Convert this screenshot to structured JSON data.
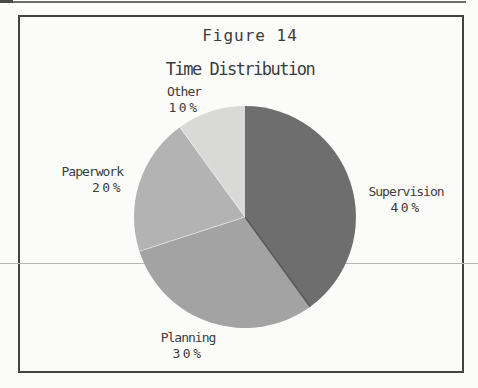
{
  "page": {
    "background_color": "#fbfbfa",
    "frame_border_color": "#434343",
    "text_color": "#3c3c3c"
  },
  "chart_data": {
    "type": "pie",
    "title": "Figure 14",
    "subtitle": "Time Distribution",
    "unit": "%",
    "direction": "clockwise",
    "start_angle_deg": 0,
    "legend_position": "labels-around-pie",
    "slices": [
      {
        "label": "Supervision",
        "value": 40,
        "pct_label": "40%",
        "color": "#6e6e6e"
      },
      {
        "label": "Planning",
        "value": 30,
        "pct_label": "30%",
        "color": "#a3a3a3"
      },
      {
        "label": "Paperwork",
        "value": 20,
        "pct_label": "20%",
        "color": "#b3b3b3"
      },
      {
        "label": "Other",
        "value": 10,
        "pct_label": "10%",
        "color": "#d9d9d7"
      }
    ]
  }
}
